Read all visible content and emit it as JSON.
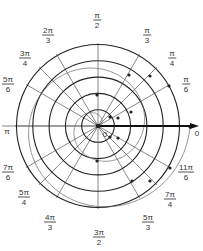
{
  "diagram": {
    "title": "",
    "center": [
      98,
      126
    ],
    "unit_px": 16.3,
    "circle_radii": [
      1,
      2,
      3,
      4,
      5
    ],
    "colors": {
      "grid_circle": "#222222",
      "ray": "#555555",
      "spiral": "#666666",
      "point": "#222222",
      "axis": "#111111"
    },
    "origin_label": "0",
    "axis_end_label": "0",
    "pi_label": "π",
    "angle_labels": [
      {
        "id": "pi-6",
        "num": "π",
        "den": "6",
        "x": 186,
        "y": 84
      },
      {
        "id": "pi-4",
        "num": "π",
        "den": "4",
        "x": 172,
        "y": 58
      },
      {
        "id": "pi-3",
        "num": "π",
        "den": "3",
        "x": 147,
        "y": 35
      },
      {
        "id": "pi-2",
        "num": "π",
        "den": "2",
        "x": 97,
        "y": 20
      },
      {
        "id": "2pi-3",
        "num": "2π",
        "den": "3",
        "x": 48,
        "y": 35
      },
      {
        "id": "3pi-4",
        "num": "3π",
        "den": "4",
        "x": 25,
        "y": 58
      },
      {
        "id": "5pi-6",
        "num": "5π",
        "den": "6",
        "x": 8,
        "y": 84
      },
      {
        "id": "7pi-6",
        "num": "7π",
        "den": "6",
        "x": 8,
        "y": 172
      },
      {
        "id": "5pi-4",
        "num": "5π",
        "den": "4",
        "x": 24,
        "y": 197
      },
      {
        "id": "4pi-3",
        "num": "4π",
        "den": "3",
        "x": 50,
        "y": 222
      },
      {
        "id": "3pi-2",
        "num": "3π",
        "den": "2",
        "x": 99,
        "y": 237
      },
      {
        "id": "5pi-3",
        "num": "5π",
        "den": "3",
        "x": 148,
        "y": 222
      },
      {
        "id": "7pi-4",
        "num": "7π",
        "den": "4",
        "x": 170,
        "y": 199
      },
      {
        "id": "11pi-6",
        "num": "11π",
        "den": "6",
        "x": 186,
        "y": 172
      }
    ],
    "rays_deg": [
      0,
      30,
      45,
      60,
      90,
      120,
      135,
      150,
      180,
      210,
      225,
      240,
      270,
      300,
      315,
      330
    ],
    "spiral": {
      "equation": "r = θ (scaled)",
      "points": [
        [
          131,
          112
        ],
        [
          118,
          118
        ],
        [
          110,
          117
        ],
        [
          97,
          95
        ],
        [
          129,
          75
        ],
        [
          150,
          76
        ],
        [
          169,
          86
        ],
        [
          98,
          126
        ],
        [
          110,
          137
        ],
        [
          118,
          138
        ],
        [
          97,
          161
        ],
        [
          132,
          181
        ],
        [
          150,
          181
        ],
        [
          170,
          168
        ],
        [
          190,
          127
        ]
      ]
    }
  }
}
